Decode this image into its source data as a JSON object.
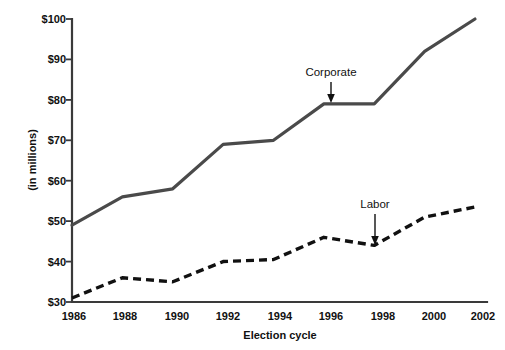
{
  "chart_data": {
    "type": "line",
    "title": "",
    "xlabel": "Election cycle",
    "ylabel": "(in millions)",
    "categories": [
      "1986",
      "1988",
      "1990",
      "1992",
      "1994",
      "1996",
      "1998",
      "2000",
      "2002"
    ],
    "x": [
      1986,
      1988,
      1990,
      1992,
      1994,
      1996,
      1998,
      2000,
      2002
    ],
    "xlim": [
      1986,
      2002
    ],
    "ylim": [
      30,
      100
    ],
    "ytick_values": [
      30,
      40,
      50,
      60,
      70,
      80,
      90,
      100
    ],
    "ytick_labels": [
      "$30",
      "$40",
      "$50",
      "$60",
      "$70",
      "$80",
      "$90",
      "$100"
    ],
    "xtick_labels": [
      "1986",
      "1988",
      "1990",
      "1992",
      "1994",
      "1996",
      "1998",
      "2000",
      "2002"
    ],
    "grid": false,
    "legend_position": "inline-annotations",
    "series": [
      {
        "name": "Corporate",
        "style": "solid",
        "color": "#4a4a4a",
        "values": [
          49,
          56,
          58,
          69,
          70,
          79,
          79,
          92,
          100
        ]
      },
      {
        "name": "Labor",
        "style": "dashed",
        "color": "#111111",
        "values": [
          31,
          36,
          35,
          40,
          40.5,
          46,
          44,
          51,
          53.5
        ]
      }
    ],
    "annotations": [
      {
        "text": "Corporate",
        "series": "Corporate",
        "at_x": 1996,
        "at_y": 79
      },
      {
        "text": "Labor",
        "series": "Labor",
        "at_x": 1998,
        "at_y": 44
      }
    ]
  }
}
